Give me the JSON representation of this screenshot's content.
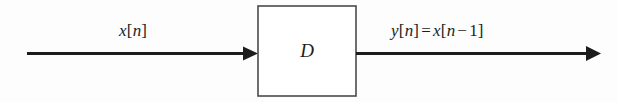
{
  "figure": {
    "type": "block-diagram",
    "background_color": "#fdfdfd",
    "stroke_color": "#1c1c1c"
  },
  "input": {
    "label_plain": "x[n]",
    "variable": "x",
    "open_bracket": "[",
    "index": "n",
    "close_bracket": "]"
  },
  "block": {
    "label": "D",
    "name": "delay-block",
    "border_color": "#4a4a4a",
    "fill_color": "#ffffff"
  },
  "output": {
    "label_plain": "y[n] = x[n − 1]",
    "lhs_variable": "y",
    "lhs_open_bracket": "[",
    "lhs_index": "n",
    "lhs_close_bracket": "]",
    "equals": "=",
    "rhs_variable": "x",
    "rhs_open_bracket": "[",
    "rhs_index": "n",
    "rhs_minus": "−",
    "rhs_offset": "1",
    "rhs_close_bracket": "]"
  },
  "arrows": {
    "input_arrow_name": "input-arrow",
    "output_arrow_name": "output-arrow"
  }
}
